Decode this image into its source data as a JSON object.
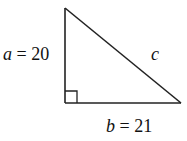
{
  "diagram": {
    "type": "right-triangle",
    "vertices": {
      "top": [
        65,
        8
      ],
      "right_angle": [
        65,
        103
      ],
      "right": [
        181,
        103
      ]
    },
    "right_angle_marker_size": 12,
    "stroke_color": "#222222",
    "labels": {
      "a": {
        "var": "a",
        "eq": " = 20",
        "pos": [
          3,
          60
        ]
      },
      "b": {
        "var": "b",
        "eq": " = 21",
        "pos": [
          106,
          132
        ]
      },
      "c": {
        "var": "c",
        "pos": [
          151,
          60
        ]
      }
    }
  }
}
